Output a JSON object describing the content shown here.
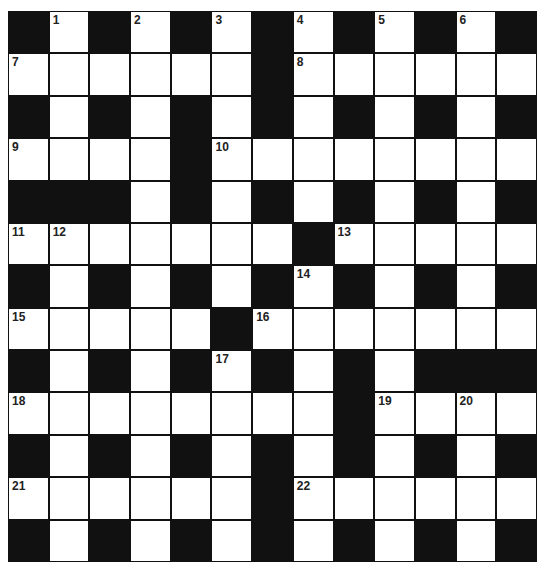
{
  "puzzle": {
    "rows": 13,
    "cols": 13,
    "layout": [
      "#.#.#.#.#.#.#",
      "......#......",
      "#.#.#.#.#.#.#",
      "....#........",
      "###.#.#.#.#.#",
      ".......#.....",
      "#.#.#.#.#.#.#",
      ".....#.......",
      "#.#.#.#.#.###",
      "........#....",
      "#.#.#.#.#.#.#",
      "......#......",
      "#.#.#.#.#.#.#"
    ],
    "numbers": [
      {
        "r": 0,
        "c": 1,
        "n": "1"
      },
      {
        "r": 0,
        "c": 3,
        "n": "2"
      },
      {
        "r": 0,
        "c": 5,
        "n": "3"
      },
      {
        "r": 0,
        "c": 7,
        "n": "4"
      },
      {
        "r": 0,
        "c": 9,
        "n": "5"
      },
      {
        "r": 0,
        "c": 11,
        "n": "6"
      },
      {
        "r": 1,
        "c": 0,
        "n": "7"
      },
      {
        "r": 1,
        "c": 7,
        "n": "8"
      },
      {
        "r": 3,
        "c": 0,
        "n": "9"
      },
      {
        "r": 3,
        "c": 5,
        "n": "10"
      },
      {
        "r": 5,
        "c": 0,
        "n": "11"
      },
      {
        "r": 5,
        "c": 1,
        "n": "12"
      },
      {
        "r": 5,
        "c": 8,
        "n": "13"
      },
      {
        "r": 6,
        "c": 7,
        "n": "14"
      },
      {
        "r": 7,
        "c": 0,
        "n": "15"
      },
      {
        "r": 7,
        "c": 6,
        "n": "16"
      },
      {
        "r": 8,
        "c": 5,
        "n": "17"
      },
      {
        "r": 9,
        "c": 0,
        "n": "18"
      },
      {
        "r": 9,
        "c": 9,
        "n": "19"
      },
      {
        "r": 9,
        "c": 11,
        "n": "20"
      },
      {
        "r": 11,
        "c": 0,
        "n": "21"
      },
      {
        "r": 11,
        "c": 7,
        "n": "22"
      }
    ],
    "colors": {
      "block": "#111111",
      "cell": "#ffffff",
      "number": "#222222"
    }
  }
}
